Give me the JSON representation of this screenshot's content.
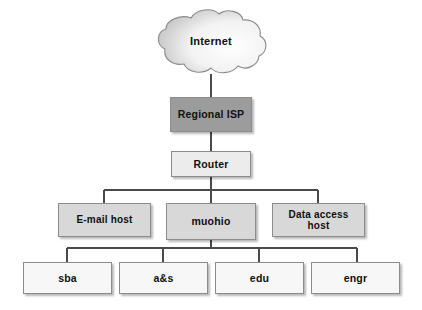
{
  "diagram": {
    "background_color": "#ffffff",
    "line_color": "#4a4a4a",
    "colors": {
      "cloud_fill_light": "#ffffff",
      "cloud_fill_shade": "#c9c9c9",
      "cloud_border": "#8c8c8c",
      "isp_fill": "#9c9c9c",
      "router_fill": "#ececec",
      "tier_fill": "#d8d8d8",
      "leaf_fill": "#f7f7f7",
      "box_border": "#8c8c8c",
      "text_color": "#111111"
    },
    "nodes": {
      "internet": {
        "label": "Internet",
        "shape": "cloud"
      },
      "regional_isp": {
        "label": "Regional ISP",
        "shape": "rectangle"
      },
      "router": {
        "label": "Router",
        "shape": "rectangle"
      },
      "email_host": {
        "label": "E-mail host",
        "shape": "rectangle"
      },
      "muohio": {
        "label": "muohio",
        "shape": "rectangle"
      },
      "data_access_host": {
        "label_line1": "Data access",
        "label_line2": "host",
        "shape": "rectangle"
      },
      "sba": {
        "label": "sba",
        "shape": "rectangle"
      },
      "as": {
        "label": "a&s",
        "shape": "rectangle"
      },
      "edu": {
        "label": "edu",
        "shape": "rectangle"
      },
      "engr": {
        "label": "engr",
        "shape": "rectangle"
      }
    },
    "edges": [
      {
        "from": "internet",
        "to": "regional_isp"
      },
      {
        "from": "regional_isp",
        "to": "router"
      },
      {
        "from": "router",
        "to": "email_host"
      },
      {
        "from": "router",
        "to": "muohio"
      },
      {
        "from": "router",
        "to": "data_access_host"
      },
      {
        "from": "muohio",
        "to": "sba"
      },
      {
        "from": "muohio",
        "to": "as"
      },
      {
        "from": "muohio",
        "to": "edu"
      },
      {
        "from": "muohio",
        "to": "engr"
      }
    ]
  }
}
